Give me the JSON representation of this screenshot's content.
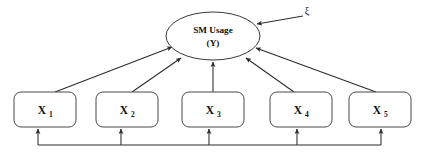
{
  "diagram": {
    "type": "path-diagram",
    "background_color": "#ffffff",
    "line_color": "#2b2b2b",
    "node_stroke_color": "#4a4a4a",
    "text_color": "#111111",
    "latent": {
      "id": "Y",
      "shape": "ellipse",
      "line1": "SM Usage",
      "line2": "(Y)",
      "cx": 213,
      "cy": 36,
      "rx": 47,
      "ry": 24
    },
    "disturbance": {
      "id": "xi",
      "symbol": "ξ",
      "x": 307,
      "y": 11
    },
    "indicators": [
      {
        "id": "X1",
        "base": "X",
        "sub": "1",
        "x": 14,
        "y": 92,
        "w": 62,
        "h": 35
      },
      {
        "id": "X2",
        "base": "X",
        "sub": "2",
        "x": 96,
        "y": 92,
        "w": 62,
        "h": 35
      },
      {
        "id": "X3",
        "base": "X",
        "sub": "3",
        "x": 182,
        "y": 92,
        "w": 62,
        "h": 35
      },
      {
        "id": "X4",
        "base": "X",
        "sub": "4",
        "x": 270,
        "y": 92,
        "w": 62,
        "h": 35
      },
      {
        "id": "X5",
        "base": "X",
        "sub": "5",
        "x": 349,
        "y": 92,
        "w": 62,
        "h": 35
      }
    ],
    "paths": [
      {
        "from": "X1",
        "to": "Y",
        "arrowhead": "to"
      },
      {
        "from": "X2",
        "to": "Y",
        "arrowhead": "to"
      },
      {
        "from": "X3",
        "to": "Y",
        "arrowhead": "to"
      },
      {
        "from": "X4",
        "to": "Y",
        "arrowhead": "to"
      },
      {
        "from": "X5",
        "to": "Y",
        "arrowhead": "to"
      },
      {
        "from": "xi",
        "to": "Y",
        "arrowhead": "to"
      },
      {
        "from": "bus",
        "to": "X1",
        "arrowhead": "to"
      },
      {
        "from": "bus",
        "to": "X2",
        "arrowhead": "to"
      },
      {
        "from": "bus",
        "to": "X3",
        "arrowhead": "to"
      },
      {
        "from": "bus",
        "to": "X4",
        "arrowhead": "to"
      },
      {
        "from": "bus",
        "to": "X5",
        "arrowhead": "to"
      }
    ],
    "bus_line": {
      "y": 145,
      "x_start": 38,
      "x_end": 381
    }
  }
}
